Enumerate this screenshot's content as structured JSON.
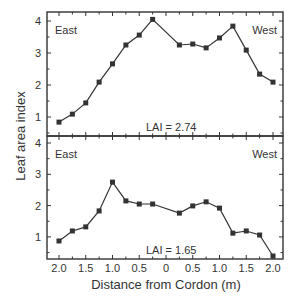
{
  "chart_data": {
    "type": "line",
    "ylabel": "Leaf area index",
    "xlabel": "Distance from Cordon (m)",
    "x_tick_labels": [
      "2.0",
      "1.5",
      "1.0",
      "0.5",
      "0",
      "0.5",
      "1.0",
      "1.5",
      "2.0"
    ],
    "x": [
      -2.0,
      -1.75,
      -1.5,
      -1.25,
      -1.0,
      -0.75,
      -0.5,
      -0.25,
      0.25,
      0.5,
      0.75,
      1.0,
      1.25,
      1.5,
      1.75,
      2.0
    ],
    "x_direction_note": "Left half labeled East, right half labeled West",
    "panels": [
      {
        "position": "top",
        "left_label": "East",
        "right_label": "West",
        "annotation": "LAI = 2.74",
        "y_ticks": [
          1,
          2,
          3,
          4
        ],
        "ylim": [
          0.4,
          4.1
        ],
        "values": [
          0.84,
          1.09,
          1.44,
          2.09,
          2.66,
          3.25,
          3.56,
          4.05,
          3.25,
          3.28,
          3.16,
          3.47,
          3.84,
          3.09,
          2.34,
          2.09
        ]
      },
      {
        "position": "bottom",
        "left_label": "East",
        "right_label": "West",
        "annotation": "LAI = 1.65",
        "y_ticks": [
          1,
          2,
          3,
          4
        ],
        "ylim": [
          0.35,
          4.1
        ],
        "values": [
          0.87,
          1.19,
          1.32,
          1.83,
          2.75,
          2.15,
          2.05,
          2.05,
          1.76,
          1.99,
          2.12,
          1.92,
          1.12,
          1.19,
          1.06,
          0.39
        ]
      }
    ],
    "colors": {
      "line": "#333333",
      "marker": "#333333",
      "frame": "#333333"
    }
  }
}
